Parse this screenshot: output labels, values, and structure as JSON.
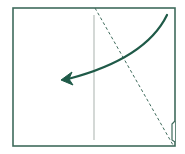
{
  "diagram": {
    "type": "origami-fold-step",
    "colors": {
      "paper_outline": "#3f6b5c",
      "crease": "#b8bfbb",
      "valley_fold": "#3f6b5c",
      "arrow": "#1f5a48",
      "background": "#ffffff"
    },
    "paper": {
      "x": 13,
      "y": 8,
      "width": 162,
      "height": 138
    },
    "elements": [
      {
        "name": "center-crease",
        "kind": "crease-line",
        "from": [
          94,
          15
        ],
        "to": [
          94,
          140
        ]
      },
      {
        "name": "valley-fold-line",
        "kind": "dashed-line",
        "from": [
          95,
          8
        ],
        "to": [
          173,
          145
        ]
      },
      {
        "name": "fold-arrow",
        "kind": "curved-arrow",
        "from": [
          167,
          15
        ],
        "to": [
          62,
          80
        ],
        "direction": "right-to-left"
      },
      {
        "name": "corner-flap",
        "kind": "flap-edge",
        "from": [
          175,
          122
        ],
        "to": [
          175,
          142
        ]
      }
    ]
  }
}
